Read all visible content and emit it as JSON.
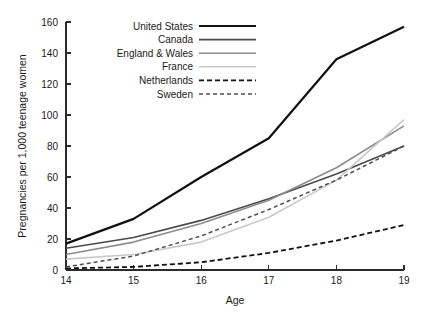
{
  "chart_data": {
    "type": "line",
    "title": "",
    "xlabel": "Age",
    "ylabel": "Pregnancies per 1,000 teenage women",
    "x": [
      14,
      15,
      16,
      17,
      18,
      19
    ],
    "xticklabels": [
      "14",
      "15",
      "16",
      "17",
      "18",
      "19"
    ],
    "yticklabels": [
      "0",
      "20",
      "40",
      "60",
      "80",
      "100",
      "120",
      "140",
      "160"
    ],
    "yticks": [
      0,
      20,
      40,
      60,
      80,
      100,
      120,
      140,
      160
    ],
    "xlim": [
      14,
      19
    ],
    "ylim": [
      0,
      160
    ],
    "grid": false,
    "legend_position": "top-center",
    "series": [
      {
        "name": "United States",
        "values": [
          17,
          33,
          60,
          85,
          136,
          157
        ],
        "color": "#111111",
        "width": 2.2,
        "dash": "none"
      },
      {
        "name": "Canada",
        "values": [
          14,
          21,
          32,
          46,
          62,
          80
        ],
        "color": "#4a4a4a",
        "width": 1.6,
        "dash": "none"
      },
      {
        "name": "England & Wales",
        "values": [
          10,
          18,
          30,
          45,
          66,
          93
        ],
        "color": "#8c8c8c",
        "width": 1.6,
        "dash": "none"
      },
      {
        "name": "France",
        "values": [
          7,
          10,
          18,
          34,
          58,
          97
        ],
        "color": "#c9c9c9",
        "width": 1.6,
        "dash": "none"
      },
      {
        "name": "Netherlands",
        "values": [
          1,
          2,
          5,
          11,
          19,
          29
        ],
        "color": "#111111",
        "width": 1.8,
        "dash": "5,3"
      },
      {
        "name": "Sweden",
        "values": [
          2,
          9,
          22,
          39,
          58,
          80
        ],
        "color": "#4f4f4f",
        "width": 1.5,
        "dash": "4,3"
      }
    ]
  },
  "legend": {
    "items": [
      {
        "label": "United States"
      },
      {
        "label": "Canada"
      },
      {
        "label": "England & Wales"
      },
      {
        "label": "France"
      },
      {
        "label": "Netherlands"
      },
      {
        "label": "Sweden"
      }
    ]
  }
}
